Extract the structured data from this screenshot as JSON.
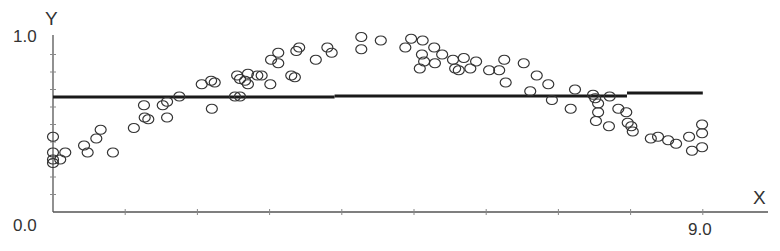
{
  "chart_data": {
    "type": "scatter",
    "title": "",
    "xlabel": "X",
    "ylabel": "Y",
    "xlim": [
      0,
      10.0
    ],
    "ylim": [
      0,
      1.0
    ],
    "x_ticks_labeled": [
      "9.0"
    ],
    "y_ticks_labeled": [
      "0.0",
      "1.0"
    ],
    "x_tick_step": 1.0,
    "y_tick_step": 0.1,
    "grid": false,
    "legend": null,
    "series": [
      {
        "name": "observations",
        "marker": "open-circle",
        "points": [
          [
            0.0,
            0.43
          ],
          [
            0.0,
            0.34
          ],
          [
            0.0,
            0.3
          ],
          [
            0.0,
            0.28
          ],
          [
            0.1,
            0.3
          ],
          [
            0.17,
            0.34
          ],
          [
            0.43,
            0.38
          ],
          [
            0.48,
            0.34
          ],
          [
            0.6,
            0.42
          ],
          [
            0.66,
            0.47
          ],
          [
            0.83,
            0.34
          ],
          [
            1.12,
            0.48
          ],
          [
            1.26,
            0.61
          ],
          [
            1.27,
            0.54
          ],
          [
            1.32,
            0.53
          ],
          [
            1.52,
            0.61
          ],
          [
            1.58,
            0.63
          ],
          [
            1.58,
            0.54
          ],
          [
            1.75,
            0.66
          ],
          [
            2.06,
            0.73
          ],
          [
            2.19,
            0.75
          ],
          [
            2.24,
            0.74
          ],
          [
            2.2,
            0.59
          ],
          [
            2.52,
            0.66
          ],
          [
            2.59,
            0.66
          ],
          [
            2.55,
            0.78
          ],
          [
            2.59,
            0.76
          ],
          [
            2.66,
            0.75
          ],
          [
            2.7,
            0.73
          ],
          [
            2.7,
            0.79
          ],
          [
            2.83,
            0.78
          ],
          [
            2.89,
            0.78
          ],
          [
            3.01,
            0.73
          ],
          [
            3.02,
            0.87
          ],
          [
            3.12,
            0.91
          ],
          [
            3.12,
            0.85
          ],
          [
            3.3,
            0.78
          ],
          [
            3.35,
            0.77
          ],
          [
            3.37,
            0.92
          ],
          [
            3.41,
            0.94
          ],
          [
            3.64,
            0.87
          ],
          [
            3.8,
            0.94
          ],
          [
            3.86,
            0.91
          ],
          [
            4.27,
            1.0
          ],
          [
            4.27,
            0.93
          ],
          [
            4.54,
            0.98
          ],
          [
            4.88,
            0.94
          ],
          [
            4.96,
            0.99
          ],
          [
            5.12,
            0.98
          ],
          [
            5.11,
            0.9
          ],
          [
            5.08,
            0.82
          ],
          [
            5.14,
            0.86
          ],
          [
            5.28,
            0.94
          ],
          [
            5.29,
            0.85
          ],
          [
            5.39,
            0.9
          ],
          [
            5.54,
            0.87
          ],
          [
            5.57,
            0.82
          ],
          [
            5.62,
            0.81
          ],
          [
            5.69,
            0.88
          ],
          [
            5.78,
            0.82
          ],
          [
            5.86,
            0.86
          ],
          [
            6.04,
            0.81
          ],
          [
            6.18,
            0.81
          ],
          [
            6.25,
            0.87
          ],
          [
            6.27,
            0.74
          ],
          [
            6.52,
            0.85
          ],
          [
            6.7,
            0.78
          ],
          [
            6.86,
            0.73
          ],
          [
            6.61,
            0.69
          ],
          [
            6.91,
            0.64
          ],
          [
            7.23,
            0.7
          ],
          [
            7.17,
            0.59
          ],
          [
            7.48,
            0.67
          ],
          [
            7.51,
            0.65
          ],
          [
            7.55,
            0.62
          ],
          [
            7.55,
            0.57
          ],
          [
            7.52,
            0.52
          ],
          [
            7.7,
            0.49
          ],
          [
            7.71,
            0.66
          ],
          [
            7.83,
            0.59
          ],
          [
            7.94,
            0.57
          ],
          [
            7.96,
            0.51
          ],
          [
            8.01,
            0.49
          ],
          [
            8.03,
            0.46
          ],
          [
            8.28,
            0.42
          ],
          [
            8.38,
            0.43
          ],
          [
            8.52,
            0.41
          ],
          [
            8.63,
            0.39
          ],
          [
            8.81,
            0.43
          ],
          [
            8.99,
            0.5
          ],
          [
            8.99,
            0.45
          ],
          [
            8.85,
            0.35
          ],
          [
            8.99,
            0.37
          ]
        ]
      },
      {
        "name": "fit",
        "type": "step-line",
        "segments": [
          {
            "x0": 0.0,
            "x1": 3.9,
            "y": 0.657
          },
          {
            "x0": 3.9,
            "x1": 7.95,
            "y": 0.663
          },
          {
            "x0": 7.95,
            "x1": 9.0,
            "y": 0.68
          }
        ]
      }
    ]
  },
  "labels": {
    "y_axis": "Y",
    "x_axis": "X",
    "y_max": "1.0",
    "y_min": "0.0",
    "x_tick": "9.0"
  }
}
